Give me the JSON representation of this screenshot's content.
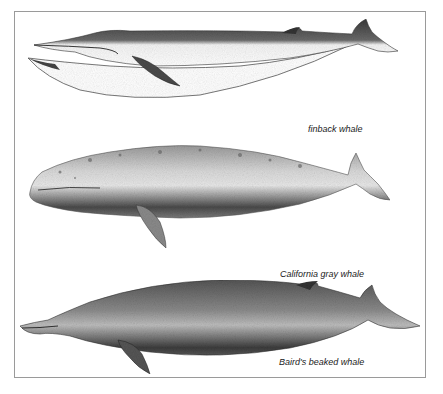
{
  "figure": {
    "panels": [
      {
        "name": "finback",
        "caption": "finback whale"
      },
      {
        "name": "gray",
        "caption": "California gray whale"
      },
      {
        "name": "bairds",
        "caption": "Baird's beaked whale"
      }
    ],
    "colors": {
      "border": "#9a9a9a",
      "ink_dark": "#2a2a2a",
      "ink_mid": "#6e6e6e",
      "ink_light": "#bdbdbd"
    }
  }
}
